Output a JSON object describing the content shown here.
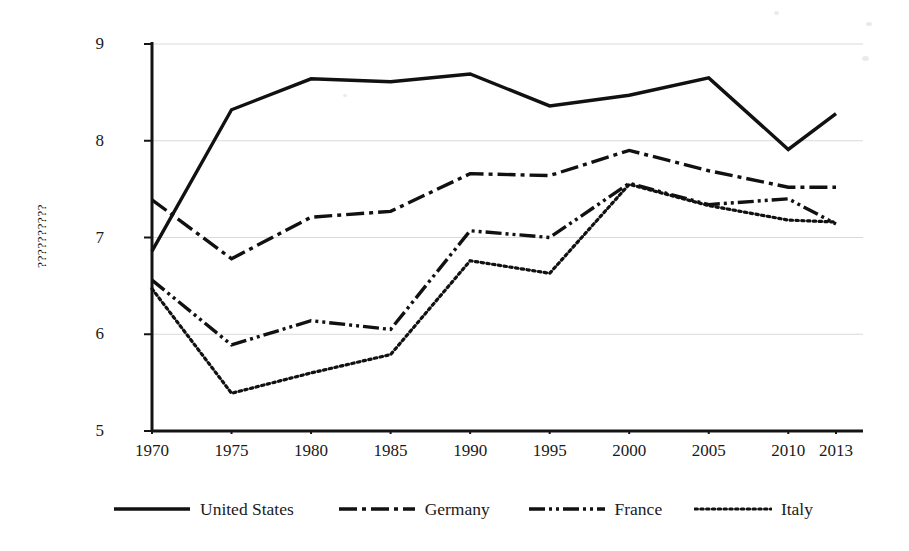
{
  "chart_data": {
    "type": "line",
    "title": "",
    "subtitle": "",
    "xlabel": "",
    "ylabel": "??????????",
    "x": [
      1970,
      1975,
      1980,
      1985,
      1990,
      1995,
      2000,
      2005,
      2010,
      2013
    ],
    "xtick_labels": [
      "1970",
      "1975",
      "1980",
      "1985",
      "1990",
      "1995",
      "2000",
      "2005",
      "2010",
      "2013"
    ],
    "ytick_labels": [
      "5",
      "6",
      "7",
      "8",
      "9"
    ],
    "yticks": [
      5,
      6,
      7,
      8,
      9
    ],
    "ylim": [
      5,
      9
    ],
    "xlim": [
      1970,
      2013
    ],
    "grid": "horizontal",
    "grid_color": "#d9d9d9",
    "legend_position": "bottom",
    "series": [
      {
        "name": "United States",
        "style": "solid",
        "color": "#111111",
        "values": [
          6.86,
          8.32,
          8.64,
          8.61,
          8.69,
          8.36,
          8.47,
          8.65,
          7.91,
          8.28
        ]
      },
      {
        "name": "Germany",
        "style": "dash-dot",
        "color": "#111111",
        "values": [
          7.39,
          6.78,
          7.21,
          7.27,
          7.66,
          7.64,
          7.9,
          7.69,
          7.52,
          7.52
        ]
      },
      {
        "name": "France",
        "style": "dash-dot-dot",
        "color": "#111111",
        "values": [
          6.56,
          5.89,
          6.14,
          6.05,
          7.07,
          7.0,
          7.56,
          7.34,
          7.4,
          7.14
        ]
      },
      {
        "name": "Italy",
        "style": "dotted",
        "color": "#111111",
        "values": [
          6.47,
          5.39,
          5.6,
          5.79,
          6.76,
          6.63,
          7.55,
          7.33,
          7.18,
          7.16
        ]
      }
    ]
  },
  "legend": {
    "items": [
      {
        "label": "United States",
        "style": "solid"
      },
      {
        "label": "Germany",
        "style": "dash-dot"
      },
      {
        "label": "France",
        "style": "dash-dot-dot"
      },
      {
        "label": "Italy",
        "style": "dotted"
      }
    ]
  }
}
